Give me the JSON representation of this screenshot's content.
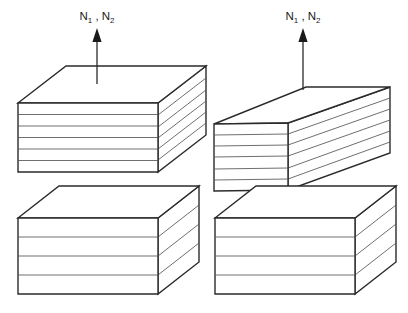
{
  "figure": {
    "title": "",
    "background_color": "#ffffff",
    "stroke_color": "#2b2b2b",
    "layer_line_color": "#555555",
    "face_fill": "#ffffff",
    "labels": {
      "left_normal": "N1 , N2",
      "right_normal": "N1 , N2",
      "symbol": "N",
      "sub_one": "1",
      "sub_two": "2",
      "separator": " , "
    },
    "annotations": {
      "left_arrow_name": "normal-vector-arrow-left",
      "right_arrow_name": "normal-vector-arrow-right"
    },
    "assemblies": [
      {
        "name": "left-assembly",
        "description": "aligned stacked layered blocks",
        "upper_block": {
          "name": "upper-block-left",
          "orientation": "front-right-isometric",
          "layer_count": 6
        },
        "lower_block": {
          "name": "lower-block-left",
          "orientation": "front-right-isometric",
          "layer_count": 4
        }
      },
      {
        "name": "right-assembly",
        "description": "upper block rotated relative to lower block",
        "upper_block": {
          "name": "upper-block-right",
          "orientation": "rotated-isometric",
          "layer_count": 6
        },
        "lower_block": {
          "name": "lower-block-right",
          "orientation": "front-right-isometric",
          "layer_count": 4
        }
      }
    ]
  }
}
